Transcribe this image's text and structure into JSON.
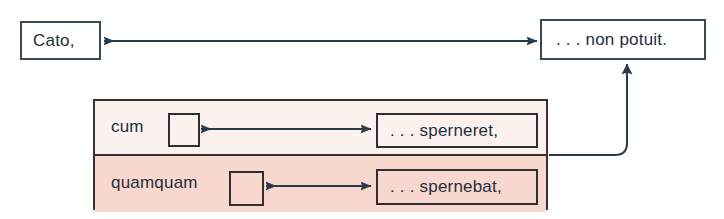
{
  "diagram": {
    "colors": {
      "page_background": "#ffffff",
      "line": "#3a4a58",
      "box_border": "#2f2f33",
      "pink_block_border": "#3a3030",
      "pink_row_top": "#fbf2f0",
      "pink_row_bottom": "#f8d7cf",
      "text": "#24303a"
    },
    "main_clause": {
      "subject_box": {
        "label": "Cato,",
        "name": "cato-box"
      },
      "predicate_box": {
        "label": ". . . non potuit.",
        "name": "non-potuit-box"
      },
      "connector": {
        "name": "cato-potuit-double-arrow",
        "type": "double-headed-arrow",
        "direction": "bidirectional"
      }
    },
    "subordinate_block": {
      "name": "subordinate-clause-block",
      "rows": [
        {
          "name": "cum-row",
          "conjunction": "cum",
          "gap_box": "",
          "clause": ". . . sperneret,",
          "connector": {
            "name": "cum-sperneret-double-arrow",
            "type": "double-headed-arrow",
            "direction": "bidirectional"
          }
        },
        {
          "name": "quamquam-row",
          "conjunction": "quamquam",
          "gap_box": "",
          "clause": ". . . spernebat,",
          "connector": {
            "name": "quamquam-spernebat-double-arrow",
            "type": "double-headed-arrow",
            "direction": "bidirectional"
          }
        }
      ],
      "uplink": {
        "name": "block-to-potuit-arrow",
        "type": "elbow-arrow",
        "direction": "up-into-non-potuit"
      }
    }
  }
}
